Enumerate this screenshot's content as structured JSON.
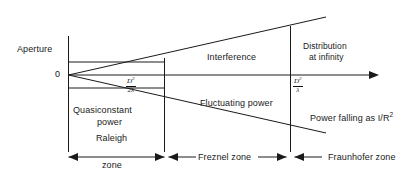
{
  "diagram": {
    "axis_origin_label": "0",
    "labels": {
      "aperture": "Aperture",
      "interference": "Interference",
      "distribution_at_infinity_line1": "Distribution",
      "distribution_at_infinity_line2": "at infinity",
      "quasiconstant_line1": "Quasiconstant",
      "quasiconstant_line2": "power",
      "fluctuating_power": "Fluctuating power",
      "power_falling_prefix": "Power falling as I/R",
      "power_falling_exponent": "2",
      "raleigh_zone_line1": "Raleigh",
      "raleigh_zone_line2": "zone",
      "freznel_zone": "Freznel zone",
      "fraunhofer_zone": "Fraunhofer zone"
    },
    "boundary_markers": [
      {
        "name": "raleigh-freznel-boundary",
        "numerator": "D",
        "numerator_exponent": "2",
        "denominator": "2λ"
      },
      {
        "name": "freznel-fraunhofer-boundary",
        "numerator": "D",
        "numerator_exponent": "2",
        "denominator": "λ"
      }
    ],
    "colors": {
      "stroke": "#1a1a1a",
      "background": "#ffffff",
      "text": "#1a1a1a"
    }
  }
}
